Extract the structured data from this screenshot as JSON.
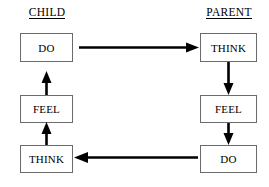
{
  "diagram": {
    "background_color": "#ffffff",
    "box_border_color": "#6b6b6b",
    "arrow_color": "#000000",
    "text_color": "#000000"
  },
  "columns": [
    {
      "id": "child",
      "header": "CHILD",
      "header_underlined": true,
      "nodes": [
        {
          "id": "child-do",
          "label": "DO"
        },
        {
          "id": "child-feel",
          "label": "FEEL"
        },
        {
          "id": "child-think",
          "label": "THINK"
        }
      ],
      "flow_direction": "upward"
    },
    {
      "id": "parent",
      "header": "PARENT",
      "header_underlined": true,
      "nodes": [
        {
          "id": "parent-think",
          "label": "THINK"
        },
        {
          "id": "parent-feel",
          "label": "FEEL"
        },
        {
          "id": "parent-do",
          "label": "DO"
        }
      ],
      "flow_direction": "downward"
    }
  ],
  "arrows": [
    {
      "id": "child-do-to-parent-think",
      "from": "child-do",
      "to": "parent-think",
      "direction": "right"
    },
    {
      "id": "parent-do-to-child-think",
      "from": "parent-do",
      "to": "child-think",
      "direction": "left"
    },
    {
      "id": "child-think-to-feel",
      "from": "child-think",
      "to": "child-feel",
      "direction": "up"
    },
    {
      "id": "child-feel-to-do",
      "from": "child-feel",
      "to": "child-do",
      "direction": "up"
    },
    {
      "id": "parent-think-to-feel",
      "from": "parent-think",
      "to": "parent-feel",
      "direction": "down"
    },
    {
      "id": "parent-feel-to-do",
      "from": "parent-feel",
      "to": "parent-do",
      "direction": "down"
    }
  ]
}
